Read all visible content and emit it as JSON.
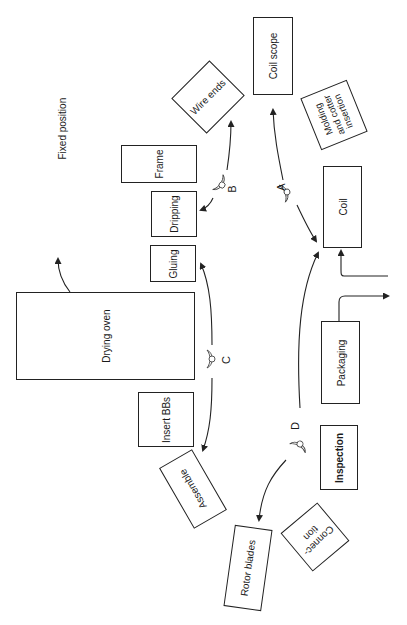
{
  "diagram": {
    "type": "assembly-process-layout",
    "stations": {
      "wire_ends": "Wire ends",
      "coil_scope": "Coil scope",
      "molding": "Molding and cotter insertion",
      "molding_l1": "Molding",
      "molding_l2": "and cotter",
      "molding_l3": "insertion",
      "frame": "Frame",
      "dripping": "Dripping",
      "gluing": "Gluing",
      "coil": "Coil",
      "drying_oven": "Drying oven",
      "packaging": "Packaging",
      "insert_bbs": "Insert BBs",
      "assemble": "Assemble",
      "inspection": "Inspection",
      "connection_l1": "Connec-",
      "connection_l2": "tion",
      "rotor_blades": "Rotor blades"
    },
    "annotations": {
      "fixed_position": "Fixed position"
    },
    "workers": {
      "a": "A",
      "b": "B",
      "c": "C",
      "d": "D"
    },
    "colors": {
      "line": "#222222",
      "background": "#ffffff"
    }
  }
}
